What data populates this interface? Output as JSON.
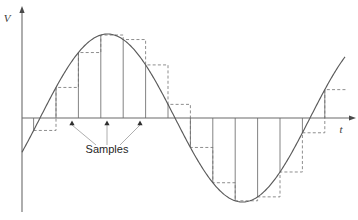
{
  "figure": {
    "kind": "sampling-diagram",
    "background": "#ffffff",
    "width": 358,
    "height": 220,
    "ink": "#5a5a5a",
    "dash_ink": "#7a7a7a",
    "text_ink": "#262626"
  },
  "axes": {
    "origin": {
      "x": 22,
      "y": 118
    },
    "vertical": {
      "label": "V",
      "label_x": 7,
      "label_y": 22,
      "top_y": 10,
      "bottom_y": 212,
      "arrow": "up-arrow"
    },
    "horizontal": {
      "label": "t",
      "label_x": 341,
      "label_y": 133,
      "left_x": 22,
      "right_x": 352,
      "arrow": "right-arrow"
    }
  },
  "callout": {
    "label": "Samples",
    "text_x": 107,
    "text_y": 153,
    "arrow_tips": [
      {
        "x": 72,
        "y": 121
      },
      {
        "x": 107,
        "y": 121
      },
      {
        "x": 140,
        "y": 121
      }
    ],
    "leader_from": [
      {
        "x": 96,
        "y": 145
      },
      {
        "x": 107,
        "y": 145
      },
      {
        "x": 120,
        "y": 145
      }
    ]
  },
  "chart_data": {
    "type": "line",
    "title": "",
    "xlabel": "t",
    "ylabel": "V",
    "grid": false,
    "legend": null,
    "baseline_y": 118,
    "amplitude_px": 84,
    "zero_crossings_x": [
      40,
      175,
      310
    ],
    "peak": {
      "x": 107,
      "y": 35
    },
    "trough": {
      "x": 243,
      "y": 202
    },
    "wave_start_x": 22,
    "wave_end_x": 345,
    "period_px": 270,
    "phase_x0": 40,
    "sample_step_px": 22.4,
    "samples": [
      {
        "index": 0,
        "x": 33.6,
        "v": -0.17
      },
      {
        "index": 1,
        "x": 56.0,
        "v": 0.37
      },
      {
        "index": 2,
        "x": 78.4,
        "v": 0.79
      },
      {
        "index": 3,
        "x": 100.8,
        "v": 0.99
      },
      {
        "index": 4,
        "x": 123.2,
        "v": 0.93
      },
      {
        "index": 5,
        "x": 145.6,
        "v": 0.62
      },
      {
        "index": 6,
        "x": 168.0,
        "v": 0.16
      },
      {
        "index": 7,
        "x": 190.4,
        "v": -0.34
      },
      {
        "index": 8,
        "x": 212.8,
        "v": -0.74
      },
      {
        "index": 9,
        "x": 235.2,
        "v": -0.98
      },
      {
        "index": 10,
        "x": 257.6,
        "v": -0.96
      },
      {
        "index": 11,
        "x": 280.0,
        "v": -0.68
      },
      {
        "index": 12,
        "x": 302.4,
        "v": -0.24
      },
      {
        "index": 13,
        "x": 324.8,
        "v": 0.29
      }
    ]
  }
}
